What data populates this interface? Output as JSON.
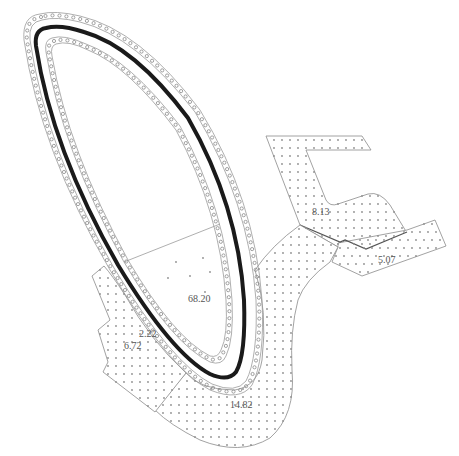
{
  "drawing": {
    "type": "site-plan",
    "colors": {
      "background": "#ffffff",
      "outline": "#8a8a8a",
      "loop": "#1a1a1a",
      "dot": "#8e8e8e",
      "label": "#555555"
    },
    "area_labels": [
      {
        "id": "central",
        "value": "68.20",
        "x": 188,
        "y": 302
      },
      {
        "id": "left-upper",
        "value": "2.22",
        "x": 139,
        "y": 337
      },
      {
        "id": "left-lower",
        "value": "6.72",
        "x": 124,
        "y": 348
      },
      {
        "id": "bottom-arc",
        "value": "14.82",
        "x": 230,
        "y": 407
      },
      {
        "id": "right-upper",
        "value": "8.13",
        "x": 312,
        "y": 214
      },
      {
        "id": "right-lower",
        "value": "5.07",
        "x": 378,
        "y": 262
      }
    ]
  }
}
